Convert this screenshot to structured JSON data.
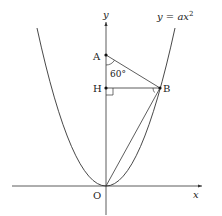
{
  "figure": {
    "type": "coordinate-geometry",
    "curve_label": "y = ax²",
    "curve_label_parts": {
      "lhs": "y",
      "eq": " = ",
      "rhs": "ax",
      "sup": "2"
    },
    "axes": {
      "x_label": "x",
      "y_label": "y"
    },
    "points": [
      {
        "name": "A",
        "label": "A"
      },
      {
        "name": "H",
        "label": "H"
      },
      {
        "name": "B",
        "label": "B"
      },
      {
        "name": "O",
        "label": "O"
      }
    ],
    "angle_label": "60°",
    "segments": [
      "AB",
      "HB",
      "OB",
      "OA"
    ],
    "markers": {
      "right_angle_at": "H",
      "angle_mark_at": "B"
    },
    "colors": {
      "line": "#333333",
      "text": "#222222",
      "background": "#ffffff"
    }
  }
}
